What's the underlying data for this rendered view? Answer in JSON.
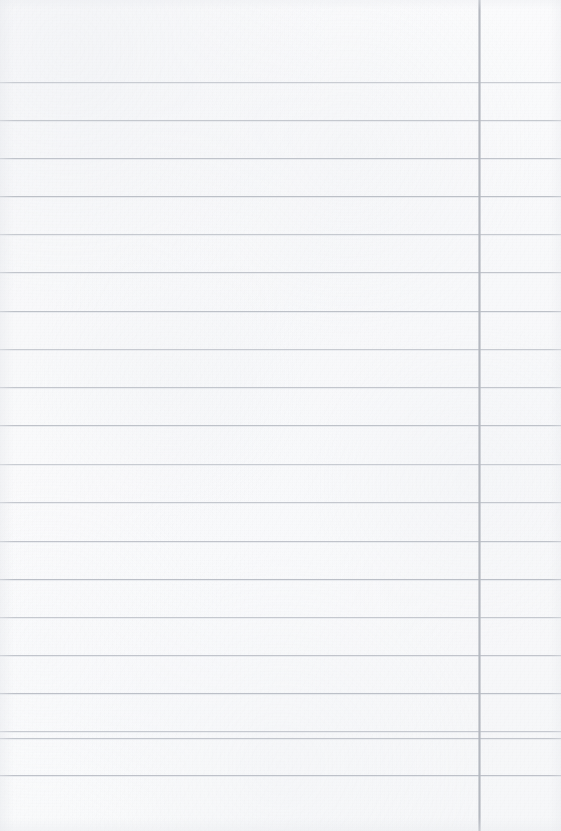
{
  "document": {
    "kind": "lined-paper-scan",
    "title": "",
    "visible_text": "",
    "page_width": 561,
    "page_height": 831,
    "paper_color": "#fcfcfd",
    "has_handwriting": false,
    "has_printed_text": false
  },
  "ruling": {
    "horizontal_rule_color": "#b8bcc4",
    "horizontal_rule_thickness": 1,
    "horizontal_rule_count": 20,
    "first_rule_y": 82,
    "rule_spacing": 38.2,
    "horizontal_rule_y": [
      82,
      120,
      158,
      196,
      234,
      272,
      311,
      349,
      387,
      425,
      464,
      502,
      541,
      579,
      617,
      655,
      693,
      731,
      738,
      775
    ],
    "vertical_rule_color": "#b0b4bc",
    "vertical_rule_thickness": 3,
    "vertical_rule_x": 478,
    "vertical_rule_count": 1,
    "top_margin_height": 82,
    "right_column_width": 80
  }
}
